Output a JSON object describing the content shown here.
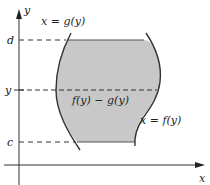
{
  "diagram": {
    "type": "region-between-curves-horizontal-slice",
    "axes": {
      "x_label": "x",
      "y_label": "y"
    },
    "y_ticks": [
      {
        "label": "d",
        "y_px": 40
      },
      {
        "label": "y",
        "y_px": 90
      },
      {
        "label": "c",
        "y_px": 142
      }
    ],
    "curves": {
      "left": {
        "label": "x = g(y)"
      },
      "right": {
        "label": "x = f(y)"
      }
    },
    "slice_label": "f(y) − g(y)",
    "colors": {
      "fill": "#c8c8c8",
      "stroke": "#333333",
      "axis": "#333333"
    }
  }
}
